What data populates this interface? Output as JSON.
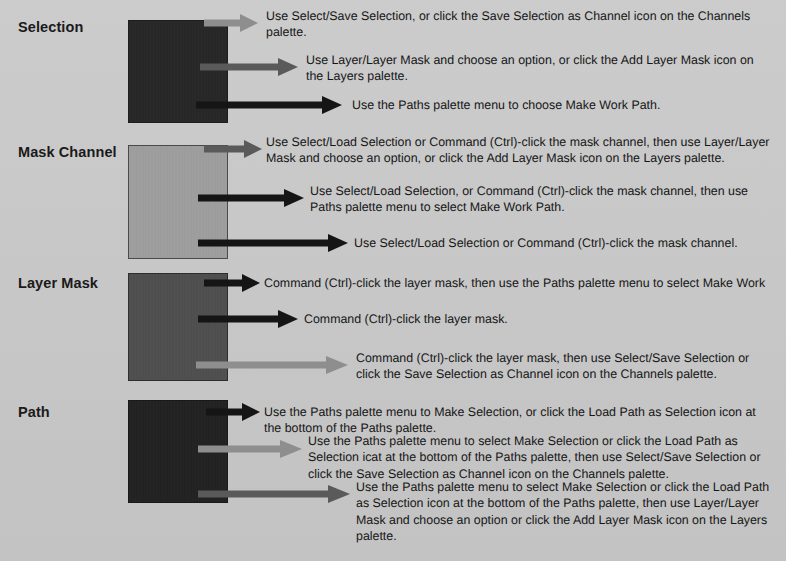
{
  "figure": {
    "background_color": "#c9c9c9",
    "text_color": "#161616"
  },
  "colors": {
    "arrow_light": "#8e8e8e",
    "arrow_medium": "#5a5a5a",
    "arrow_dark": "#151515",
    "swatch_dark": "#272727",
    "swatch_midgray": "#9e9e9e",
    "swatch_darkgray": "#4f4f4f",
    "swatch_black": "#222222"
  },
  "rows": [
    {
      "label": "Selection",
      "swatch_style": "dark",
      "callouts": [
        {
          "arrow_color": "#8e8e8e",
          "text": "Use Select/Save Selection, or click the Save Selection as Channel icon on the Channels palette."
        },
        {
          "arrow_color": "#5a5a5a",
          "text": "Use Layer/Layer Mask and choose an option, or click the Add Layer Mask icon on the Layers palette."
        },
        {
          "arrow_color": "#151515",
          "text": "Use the Paths palette menu to choose Make Work Path."
        }
      ]
    },
    {
      "label": "Mask Channel",
      "swatch_style": "midgray",
      "callouts": [
        {
          "arrow_color": "#5a5a5a",
          "text": "Use Select/Load Selection or Command (Ctrl)-click the mask channel, then use Layer/Layer Mask and choose an option, or click the Add Layer Mask icon on the Layers palette."
        },
        {
          "arrow_color": "#151515",
          "text": "Use Select/Load Selection, or Command (Ctrl)-click the mask channel, then use Paths palette menu to select Make Work Path."
        },
        {
          "arrow_color": "#151515",
          "text": "Use Select/Load Selection or Command (Ctrl)-click the mask channel."
        }
      ]
    },
    {
      "label": "Layer Mask",
      "swatch_style": "darkgray",
      "callouts": [
        {
          "arrow_color": "#151515",
          "text": "Command (Ctrl)-click the layer mask, then use the Paths palette menu to select Make Work"
        },
        {
          "arrow_color": "#151515",
          "text": "Command (Ctrl)-click the layer mask."
        },
        {
          "arrow_color": "#8e8e8e",
          "text": "Command (Ctrl)-click the layer mask, then use Select/Save Selection or click the Save Selection as Channel icon on the Channels palette."
        }
      ]
    },
    {
      "label": "Path",
      "swatch_style": "black",
      "callouts": [
        {
          "arrow_color": "#151515",
          "text": "Use the Paths palette menu to Make Selection, or click the Load Path as Selection icon at the bottom of the Paths palette."
        },
        {
          "arrow_color": "#8e8e8e",
          "text": "Use the Paths palette menu to select Make Selection or click the Load Path as Selection icat at the bottom of the Paths palette, then use Select/Save Selection or click the Save Selection as Channel icon on the Channels palette."
        },
        {
          "arrow_color": "#5a5a5a",
          "text": "Use the Paths palette menu to select Make Selection or click the Load Path as Selection icon at the bottom of the Paths palette, then use Layer/Layer Mask and choose an option or click the Add Layer Mask icon on the Layers palette."
        }
      ]
    }
  ]
}
